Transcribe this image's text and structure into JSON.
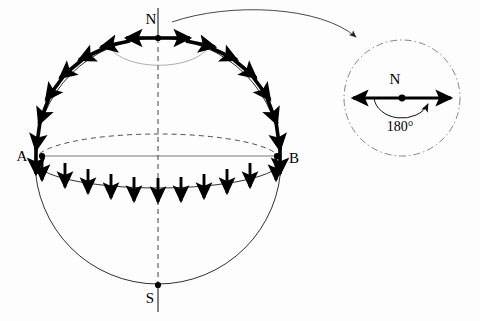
{
  "figure": {
    "labels": {
      "north_pole": "N",
      "south_pole": "S",
      "point_a": "A",
      "point_b": "B",
      "inset_center": "N",
      "inset_angle": "180°"
    },
    "sphere": {
      "center_x": 158,
      "center_y": 161,
      "radius": 123,
      "equator_ry": 27,
      "north_pole_x": 158,
      "north_pole_y": 38,
      "south_pole_x": 158,
      "south_pole_y": 285,
      "point_a_x": 42,
      "point_a_y": 155,
      "point_b_x": 277,
      "point_b_y": 155
    },
    "vectors": {
      "meridian_count": 18,
      "chord_arrow_count": 11,
      "pole_arrow_count": 2,
      "description": "tangent vectors along great circle outline and vertical arrows along front equator"
    },
    "inset": {
      "center_x": 402,
      "center_y": 98,
      "radius": 58,
      "arrow_half_length": 52,
      "angle_value": "180°"
    },
    "colors": {
      "ink": "#000000",
      "outline": "#1a1a1a",
      "hidden_line": "#555555",
      "inset_border": "#777777",
      "background": "#fdfdfd"
    }
  }
}
